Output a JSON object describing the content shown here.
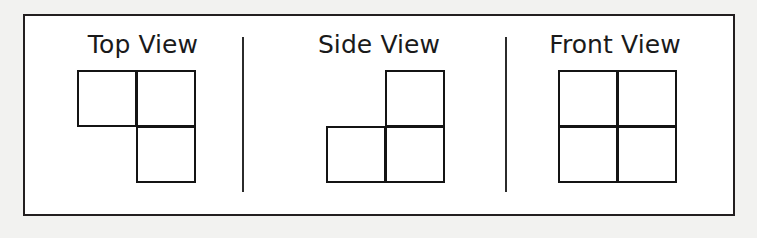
{
  "figure": {
    "background_color": "#f2f2f0",
    "frame_color": "#231f20",
    "line_color": "#141414",
    "fill_color": "#ffffff"
  },
  "panels": [
    {
      "id": "top-view",
      "label": "Top View",
      "grid": {
        "rows": 2,
        "cols": 2,
        "cells": [
          {
            "position": "top-left",
            "filled": true
          },
          {
            "position": "top-right",
            "filled": true
          },
          {
            "position": "bottom-left",
            "filled": false
          },
          {
            "position": "bottom-right",
            "filled": true
          }
        ],
        "filled_count": 3
      }
    },
    {
      "id": "side-view",
      "label": "Side View",
      "grid": {
        "rows": 2,
        "cols": 2,
        "cells": [
          {
            "position": "top-left",
            "filled": false
          },
          {
            "position": "top-right",
            "filled": true
          },
          {
            "position": "bottom-left",
            "filled": true
          },
          {
            "position": "bottom-right",
            "filled": true
          }
        ],
        "filled_count": 3
      }
    },
    {
      "id": "front-view",
      "label": "Front View",
      "grid": {
        "rows": 2,
        "cols": 2,
        "cells": [
          {
            "position": "top-left",
            "filled": true
          },
          {
            "position": "top-right",
            "filled": true
          },
          {
            "position": "bottom-left",
            "filled": true
          },
          {
            "position": "bottom-right",
            "filled": true
          }
        ],
        "filled_count": 4
      }
    }
  ],
  "dividers": [
    {
      "id": "divider-1",
      "between": "top-view|side-view"
    },
    {
      "id": "divider-2",
      "between": "side-view|front-view"
    }
  ]
}
